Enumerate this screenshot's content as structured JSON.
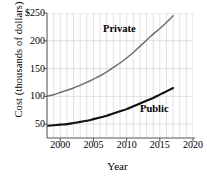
{
  "chart_data": {
    "type": "line",
    "title": "",
    "xlabel": "Year",
    "ylabel": "Cost (thousands of dollars)",
    "xlim": [
      1998,
      2020
    ],
    "ylim": [
      25,
      250
    ],
    "xticks": [
      2000,
      2005,
      2010,
      2015,
      2020
    ],
    "xtick_labels": [
      "2000",
      "2005",
      "2010",
      "2015",
      "2020"
    ],
    "yticks": [
      50,
      100,
      150,
      200,
      250
    ],
    "ytick_labels": [
      "50",
      "100",
      "150",
      "200",
      "$250"
    ],
    "grid": true,
    "grid_color": "#d8d8d8",
    "legend": "inline-labels",
    "x": [
      1998,
      1999,
      2000,
      2001,
      2002,
      2003,
      2004,
      2005,
      2006,
      2007,
      2008,
      2009,
      2010,
      2011,
      2012,
      2013,
      2014,
      2015,
      2016,
      2017
    ],
    "series": [
      {
        "name": "Private",
        "color": "#6e6e6e",
        "label_x": 2007,
        "label_y": 215,
        "values": [
          100,
          103,
          107,
          111,
          115,
          120,
          125,
          131,
          137,
          144,
          152,
          160,
          169,
          179,
          190,
          201,
          212,
          222,
          233,
          245
        ]
      },
      {
        "name": "Public",
        "color": "#111111",
        "label_x": 2013,
        "label_y": 72,
        "values": [
          47,
          48,
          49,
          50,
          52,
          54,
          56,
          59,
          62,
          65,
          69,
          73,
          77,
          82,
          87,
          92,
          97,
          103,
          109,
          115
        ]
      }
    ]
  }
}
